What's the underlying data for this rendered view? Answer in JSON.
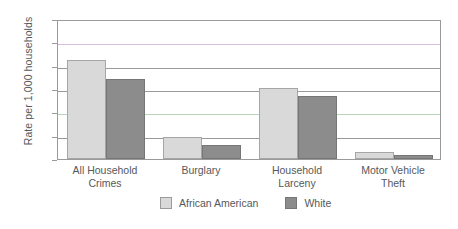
{
  "chart_data": {
    "type": "bar",
    "title": "",
    "xlabel": "",
    "ylabel": "Rate per 1,000 households",
    "ylim": [
      0,
      300
    ],
    "yticks": [
      0,
      50,
      100,
      150,
      200,
      250,
      300
    ],
    "ytick_labels": [
      "0",
      "50",
      "100",
      "150",
      "200",
      "250",
      "300"
    ],
    "grid": true,
    "legend_position": "bottom",
    "categories": [
      "All Household Crimes",
      "Burglary",
      "Household Larceny",
      "Motor Vehicle Theft"
    ],
    "category_lines": [
      [
        "All Household",
        "Crimes"
      ],
      [
        "Burglary",
        ""
      ],
      [
        "Household",
        "Larceny"
      ],
      [
        "Motor Vehicle",
        "Theft"
      ]
    ],
    "series": [
      {
        "name": "African American",
        "color": "#d9d9d9",
        "values": [
          212,
          48,
          153,
          16
        ]
      },
      {
        "name": "White",
        "color": "#8c8c8c",
        "values": [
          172,
          29,
          136,
          9
        ]
      }
    ]
  },
  "legend": {
    "entries": [
      {
        "label": "African American"
      },
      {
        "label": "White"
      }
    ]
  },
  "axis": {
    "y_title": "Rate per 1,000 households"
  }
}
